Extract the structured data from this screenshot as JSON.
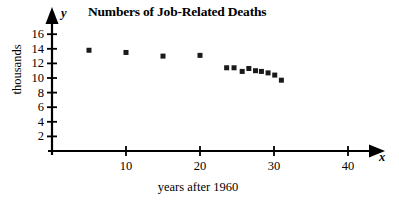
{
  "chart_data": {
    "type": "scatter",
    "title": "Numbers of Job-Related Deaths",
    "xlabel": "years after 1960",
    "ylabel": "thousands",
    "x_axis_name": "x",
    "y_axis_name": "y",
    "xlim": [
      0,
      44
    ],
    "ylim": [
      0,
      17.5
    ],
    "grid": false,
    "legend": null,
    "xticks": [
      10,
      20,
      30,
      40
    ],
    "xtick_labels": [
      "10",
      "20",
      "30",
      "40"
    ],
    "yticks": [
      2,
      4,
      6,
      8,
      10,
      12,
      14,
      16
    ],
    "ytick_labels": [
      "2",
      "4",
      "6",
      "8",
      "10",
      "12",
      "14",
      "16"
    ],
    "points": [
      {
        "x": 5,
        "y": 13.8
      },
      {
        "x": 10,
        "y": 13.5
      },
      {
        "x": 15,
        "y": 13.0
      },
      {
        "x": 20,
        "y": 13.1
      },
      {
        "x": 23.6,
        "y": 11.4
      },
      {
        "x": 24.6,
        "y": 11.4
      },
      {
        "x": 25.7,
        "y": 10.9
      },
      {
        "x": 26.6,
        "y": 11.3
      },
      {
        "x": 27.5,
        "y": 11.0
      },
      {
        "x": 28.3,
        "y": 10.9
      },
      {
        "x": 29.2,
        "y": 10.7
      },
      {
        "x": 30.1,
        "y": 10.4
      },
      {
        "x": 31.0,
        "y": 9.7
      }
    ],
    "marker": "square",
    "marker_color": "#1a1a1a",
    "axis_color": "#000000"
  }
}
